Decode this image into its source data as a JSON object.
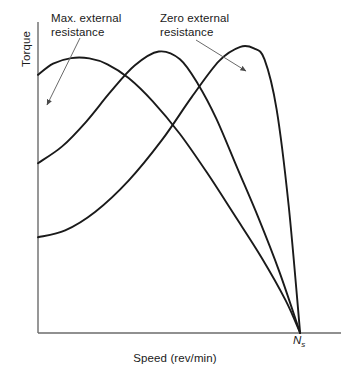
{
  "chart_data": {
    "type": "line",
    "title": "",
    "xlabel": "Speed (rev/min)",
    "ylabel": "Torque",
    "grid": false,
    "legend_position": "annotations",
    "xlim": [
      0,
      1.0
    ],
    "ylim": [
      0,
      1.0
    ],
    "axis_ticks": {
      "x": [
        "Ns"
      ],
      "y": []
    },
    "annotations": [
      {
        "text": "Max. external\nresistance",
        "points_to_series": "max-external-resistance",
        "arrow": true
      },
      {
        "text": "Zero external\nresistance",
        "points_to_series": "zero-external-resistance",
        "arrow": true
      }
    ],
    "marker_labels": [
      {
        "name": "synchronous-speed",
        "label": "N",
        "subscript": "s",
        "x": 0.868,
        "y": 0.0
      }
    ],
    "series": [
      {
        "name": "max-external-resistance",
        "label": "Max. external resistance",
        "color": "#1a1a1a",
        "x": [
          0.0,
          0.05,
          0.11,
          0.17,
          0.23,
          0.3,
          0.38,
          0.47,
          0.56,
          0.65,
          0.74,
          0.82,
          0.868
        ],
        "y": [
          0.83,
          0.866,
          0.884,
          0.883,
          0.864,
          0.82,
          0.745,
          0.64,
          0.515,
          0.38,
          0.243,
          0.105,
          0.0
        ]
      },
      {
        "name": "medium-external-resistance",
        "label": "Medium external resistance",
        "color": "#1a1a1a",
        "x": [
          0.0,
          0.08,
          0.16,
          0.24,
          0.32,
          0.4,
          0.47,
          0.53,
          0.59,
          0.66,
          0.73,
          0.8,
          0.868
        ],
        "y": [
          0.546,
          0.6,
          0.68,
          0.775,
          0.86,
          0.905,
          0.88,
          0.8,
          0.69,
          0.53,
          0.37,
          0.195,
          0.0
        ]
      },
      {
        "name": "zero-external-resistance",
        "label": "Zero external resistance",
        "color": "#1a1a1a",
        "x": [
          0.0,
          0.09,
          0.19,
          0.3,
          0.41,
          0.51,
          0.6,
          0.67,
          0.715,
          0.75,
          0.79,
          0.83,
          0.868
        ],
        "y": [
          0.308,
          0.33,
          0.39,
          0.49,
          0.62,
          0.76,
          0.875,
          0.92,
          0.915,
          0.88,
          0.72,
          0.41,
          0.0
        ]
      }
    ]
  },
  "axes": {
    "y_label": "Torque",
    "x_label": "Speed (rev/min)",
    "ns_label": "N",
    "ns_subscript": "s"
  },
  "annotations": {
    "max_resistance": "Max. external\nresistance",
    "zero_resistance": "Zero external\nresistance"
  },
  "colors": {
    "curve": "#1a1a1a",
    "axis": "#6b6b6b",
    "leader": "#555555",
    "text": "#1a1a1a",
    "background": "#ffffff"
  }
}
